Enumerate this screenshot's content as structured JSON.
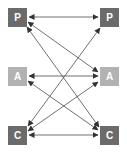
{
  "colors": {
    "dark_node": "#6b6b6b",
    "light_node": "#b2b2b2",
    "edge": "#333333"
  },
  "left_nodes": [
    {
      "id": "P",
      "label": "P",
      "shade": "dark"
    },
    {
      "id": "A",
      "label": "A",
      "shade": "light"
    },
    {
      "id": "C",
      "label": "C",
      "shade": "dark"
    }
  ],
  "right_nodes": [
    {
      "id": "P",
      "label": "P",
      "shade": "dark"
    },
    {
      "id": "A",
      "label": "A",
      "shade": "light"
    },
    {
      "id": "C",
      "label": "C",
      "shade": "dark"
    }
  ],
  "edges": [
    {
      "from": "left.P",
      "to": "right.P",
      "bidirectional": true
    },
    {
      "from": "left.P",
      "to": "right.A",
      "bidirectional": true
    },
    {
      "from": "left.P",
      "to": "right.C",
      "bidirectional": true
    },
    {
      "from": "left.A",
      "to": "right.A",
      "bidirectional": true
    },
    {
      "from": "left.A",
      "to": "right.C",
      "bidirectional": true
    },
    {
      "from": "left.C",
      "to": "right.P",
      "bidirectional": true
    },
    {
      "from": "left.C",
      "to": "right.A",
      "bidirectional": true
    },
    {
      "from": "left.C",
      "to": "right.C",
      "bidirectional": true
    }
  ]
}
